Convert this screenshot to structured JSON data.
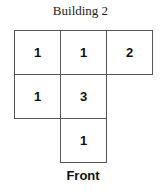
{
  "title": "Building 2",
  "grid": {
    "cells": [
      {
        "row": 0,
        "col": 0,
        "value": "1"
      },
      {
        "row": 0,
        "col": 1,
        "value": "1"
      },
      {
        "row": 0,
        "col": 2,
        "value": "2"
      },
      {
        "row": 1,
        "col": 0,
        "value": "1"
      },
      {
        "row": 1,
        "col": 1,
        "value": "3"
      },
      {
        "row": 2,
        "col": 1,
        "value": "1"
      }
    ]
  },
  "front_label": "Front"
}
